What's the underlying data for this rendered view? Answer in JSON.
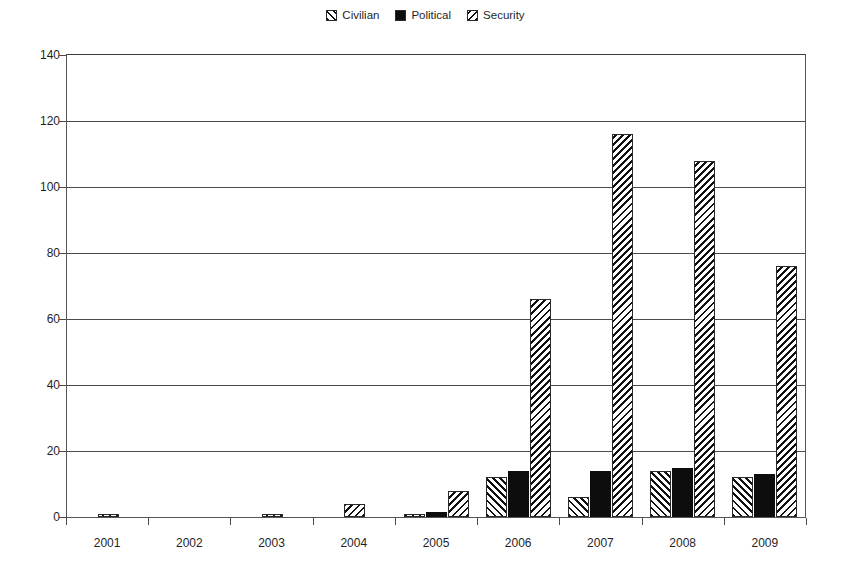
{
  "chart_data": {
    "type": "bar",
    "title": "",
    "subtitle": "",
    "xlabel": "",
    "ylabel": "",
    "categories": [
      "2001",
      "2002",
      "2003",
      "2004",
      "2005",
      "2006",
      "2007",
      "2008",
      "2009"
    ],
    "series": [
      {
        "name": "Civilian",
        "pattern": "forward-diagonal-hatch",
        "color": "#111111",
        "values": [
          0,
          0,
          0,
          0,
          1,
          12,
          6,
          14,
          12
        ]
      },
      {
        "name": "Political",
        "pattern": "solid-black",
        "color": "#0d0d0d",
        "values": [
          0,
          0,
          0,
          0,
          1.5,
          14,
          14,
          15,
          13
        ]
      },
      {
        "name": "Security",
        "pattern": "backward-diagonal-hatch",
        "color": "#111111",
        "values": [
          1,
          0,
          1,
          4,
          8,
          66,
          116,
          108,
          76
        ]
      }
    ],
    "ylim": [
      0,
      140
    ],
    "yticks": [
      0,
      20,
      40,
      60,
      80,
      100,
      120,
      140
    ],
    "ytick_labels": [
      "0",
      "20",
      "40",
      "60",
      "80",
      "100",
      "120",
      "140"
    ],
    "grid": true,
    "grid_axis": "y",
    "legend_position": "top-center",
    "background_color": "#ffffff",
    "gridline_color": "#4a4a4a",
    "axis_color": "#555555"
  },
  "legend": {
    "items": [
      {
        "label": "Civilian",
        "swatch": "hatch-forward-swatch"
      },
      {
        "label": "Political",
        "swatch": "solid-black-swatch"
      },
      {
        "label": "Security",
        "swatch": "hatch-backward-swatch"
      }
    ]
  }
}
